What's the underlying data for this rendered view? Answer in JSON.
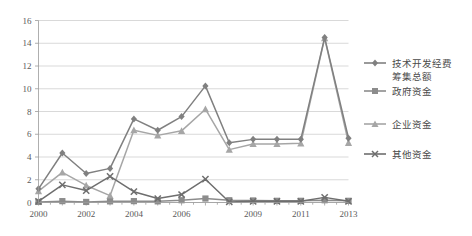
{
  "chart_data": {
    "type": "line",
    "title": "",
    "xlabel": "",
    "ylabel": "",
    "ylim": [
      0,
      16
    ],
    "ytick_step": 2,
    "yticks": [
      "0",
      "2",
      "4",
      "6",
      "8",
      "10",
      "12",
      "14",
      "16"
    ],
    "grid": true,
    "legend_position": "right",
    "categories": [
      "2000",
      "2001",
      "2002",
      "2003",
      "2004",
      "2005",
      "2006",
      "2007",
      "2008",
      "2009",
      "2010",
      "2011",
      "2012",
      "2013"
    ],
    "xtick_labels": [
      "2000",
      "",
      "2002",
      "",
      "2004",
      "",
      "2006",
      "",
      "",
      "2009",
      "",
      "2011",
      "",
      "2013"
    ],
    "xtick_labels_visible": [
      "2000",
      "2002",
      "2004",
      "2006",
      "2009",
      "2011",
      "2013"
    ],
    "series": [
      {
        "name": "技术开发经费筹集总额",
        "marker": "diamond",
        "color": "#808080",
        "values": [
          1.2,
          4.35,
          2.55,
          3.0,
          7.35,
          6.35,
          7.55,
          10.25,
          5.25,
          5.55,
          5.55,
          5.55,
          14.5,
          5.65
        ]
      },
      {
        "name": "政府资金",
        "marker": "square",
        "color": "#8c8c8c",
        "values": [
          0.05,
          0.12,
          0.05,
          0.1,
          0.12,
          0.1,
          0.2,
          0.35,
          0.2,
          0.18,
          0.15,
          0.15,
          0.2,
          0.15
        ]
      },
      {
        "name": "企业资金",
        "marker": "triangle",
        "color": "#a6a6a6",
        "values": [
          1.0,
          2.65,
          1.5,
          0.6,
          6.35,
          5.9,
          6.3,
          8.2,
          4.65,
          5.15,
          5.15,
          5.2,
          14.45,
          5.25
        ]
      },
      {
        "name": "其他资金",
        "marker": "cross",
        "color": "#6e6e6e",
        "values": [
          0.1,
          1.55,
          1.05,
          2.3,
          0.95,
          0.35,
          0.7,
          2.05,
          0.05,
          0.1,
          0.1,
          0.1,
          0.45,
          0.1
        ]
      }
    ]
  },
  "legend": {
    "items": [
      {
        "label_line1": "技术开发经费",
        "label_line2": "筹集总额",
        "marker": "diamond"
      },
      {
        "label_line1": "政府资金",
        "label_line2": "",
        "marker": "square"
      },
      {
        "label_line1": "企业资金",
        "label_line2": "",
        "marker": "triangle"
      },
      {
        "label_line1": "其他资金",
        "label_line2": "",
        "marker": "cross"
      }
    ]
  },
  "colors": {
    "grid": "#c8c8c8",
    "axis": "#9a9a9a",
    "tick_text": "#5a5a5a",
    "legend_text": "#4a4a4a",
    "background": "#ffffff"
  }
}
